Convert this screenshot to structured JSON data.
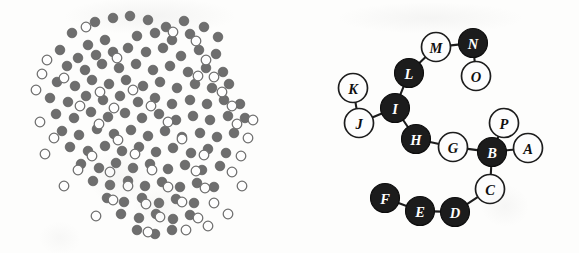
{
  "figure": {
    "background_color": "#fdfdfc",
    "panels": [
      {
        "id": "cluster",
        "name": "Particle cluster scatter"
      },
      {
        "id": "graph",
        "name": "Labeled node-link chain graph"
      }
    ]
  },
  "cluster_panel": {
    "name": "particle-cluster",
    "filled_color": "#6e6e6e",
    "open_fill_color": "#fefefe",
    "open_stroke_color": "#6f6f6f",
    "dot_radius": 4.8,
    "filled_count": 104,
    "open_count": 52,
    "total_count": 156,
    "filled_dots": [
      [
        95,
        22
      ],
      [
        113,
        18
      ],
      [
        130,
        16
      ],
      [
        148,
        20
      ],
      [
        166,
        27
      ],
      [
        184,
        21
      ],
      [
        204,
        27
      ],
      [
        72,
        33
      ],
      [
        88,
        45
      ],
      [
        105,
        40
      ],
      [
        137,
        36
      ],
      [
        155,
        33
      ],
      [
        172,
        40
      ],
      [
        190,
        34
      ],
      [
        218,
        37
      ],
      [
        60,
        50
      ],
      [
        78,
        58
      ],
      [
        96,
        55
      ],
      [
        113,
        52
      ],
      [
        128,
        48
      ],
      [
        146,
        52
      ],
      [
        163,
        48
      ],
      [
        181,
        56
      ],
      [
        199,
        50
      ],
      [
        216,
        54
      ],
      [
        67,
        66
      ],
      [
        85,
        70
      ],
      [
        102,
        64
      ],
      [
        119,
        68
      ],
      [
        136,
        64
      ],
      [
        153,
        70
      ],
      [
        170,
        66
      ],
      [
        188,
        72
      ],
      [
        206,
        68
      ],
      [
        223,
        72
      ],
      [
        57,
        82
      ],
      [
        75,
        86
      ],
      [
        92,
        80
      ],
      [
        109,
        84
      ],
      [
        126,
        80
      ],
      [
        143,
        86
      ],
      [
        160,
        82
      ],
      [
        177,
        88
      ],
      [
        195,
        84
      ],
      [
        212,
        88
      ],
      [
        229,
        84
      ],
      [
        50,
        98
      ],
      [
        68,
        102
      ],
      [
        86,
        96
      ],
      [
        103,
        100
      ],
      [
        120,
        96
      ],
      [
        138,
        102
      ],
      [
        155,
        98
      ],
      [
        172,
        104
      ],
      [
        190,
        100
      ],
      [
        207,
        104
      ],
      [
        224,
        100
      ],
      [
        240,
        104
      ],
      [
        56,
        114
      ],
      [
        74,
        118
      ],
      [
        91,
        112
      ],
      [
        108,
        117
      ],
      [
        125,
        113
      ],
      [
        142,
        118
      ],
      [
        159,
        114
      ],
      [
        176,
        120
      ],
      [
        193,
        116
      ],
      [
        210,
        120
      ],
      [
        228,
        116
      ],
      [
        245,
        118
      ],
      [
        62,
        131
      ],
      [
        79,
        135
      ],
      [
        97,
        129
      ],
      [
        114,
        134
      ],
      [
        131,
        130
      ],
      [
        148,
        136
      ],
      [
        165,
        131
      ],
      [
        182,
        137
      ],
      [
        200,
        133
      ],
      [
        217,
        137
      ],
      [
        234,
        133
      ],
      [
        70,
        147
      ],
      [
        88,
        151
      ],
      [
        105,
        146
      ],
      [
        122,
        151
      ],
      [
        139,
        147
      ],
      [
        156,
        152
      ],
      [
        173,
        148
      ],
      [
        191,
        153
      ],
      [
        208,
        149
      ],
      [
        226,
        153
      ],
      [
        81,
        164
      ],
      [
        99,
        168
      ],
      [
        116,
        163
      ],
      [
        133,
        168
      ],
      [
        150,
        164
      ],
      [
        168,
        169
      ],
      [
        185,
        165
      ],
      [
        202,
        170
      ],
      [
        220,
        166
      ],
      [
        93,
        181
      ],
      [
        110,
        185
      ],
      [
        128,
        181
      ],
      [
        145,
        186
      ],
      [
        162,
        182
      ],
      [
        180,
        187
      ],
      [
        197,
        183
      ],
      [
        214,
        187
      ],
      [
        107,
        198
      ],
      [
        124,
        202
      ],
      [
        142,
        198
      ],
      [
        159,
        203
      ],
      [
        176,
        199
      ],
      [
        194,
        203
      ],
      [
        121,
        214
      ],
      [
        139,
        218
      ],
      [
        156,
        214
      ],
      [
        173,
        219
      ],
      [
        190,
        215
      ],
      [
        137,
        230
      ],
      [
        155,
        234
      ],
      [
        172,
        230
      ]
    ],
    "open_dots": [
      [
        86,
        27
      ],
      [
        173,
        32
      ],
      [
        196,
        41
      ],
      [
        47,
        60
      ],
      [
        117,
        58
      ],
      [
        206,
        60
      ],
      [
        42,
        74
      ],
      [
        64,
        78
      ],
      [
        198,
        76
      ],
      [
        214,
        77
      ],
      [
        36,
        90
      ],
      [
        100,
        92
      ],
      [
        133,
        90
      ],
      [
        222,
        92
      ],
      [
        80,
        106
      ],
      [
        114,
        108
      ],
      [
        151,
        106
      ],
      [
        232,
        106
      ],
      [
        40,
        122
      ],
      [
        99,
        124
      ],
      [
        168,
        122
      ],
      [
        237,
        124
      ],
      [
        253,
        120
      ],
      [
        54,
        138
      ],
      [
        118,
        140
      ],
      [
        182,
        139
      ],
      [
        248,
        138
      ],
      [
        45,
        154
      ],
      [
        92,
        156
      ],
      [
        135,
        154
      ],
      [
        204,
        155
      ],
      [
        241,
        156
      ],
      [
        78,
        170
      ],
      [
        110,
        172
      ],
      [
        152,
        170
      ],
      [
        196,
        171
      ],
      [
        232,
        172
      ],
      [
        64,
        186
      ],
      [
        128,
        186
      ],
      [
        168,
        187
      ],
      [
        205,
        188
      ],
      [
        242,
        186
      ],
      [
        113,
        200
      ],
      [
        146,
        204
      ],
      [
        182,
        202
      ],
      [
        214,
        203
      ],
      [
        96,
        216
      ],
      [
        160,
        217
      ],
      [
        198,
        218
      ],
      [
        228,
        214
      ],
      [
        148,
        232
      ],
      [
        186,
        230
      ],
      [
        208,
        226
      ]
    ]
  },
  "graph_panel": {
    "name": "node-link-graph",
    "node_radius": 14.5,
    "black_fill": "#1c1c1c",
    "white_fill": "#fdfdfd",
    "edge_color": "#1d1d1d",
    "black_label_color": "#ffffff",
    "white_label_color": "#101010",
    "node_count": 16,
    "edge_count": 15,
    "black_node_count": 8,
    "white_node_count": 8,
    "nodes": [
      {
        "label": "A",
        "x": 232,
        "y": 148,
        "fill": "white"
      },
      {
        "label": "B",
        "x": 196,
        "y": 152,
        "fill": "black"
      },
      {
        "label": "C",
        "x": 194,
        "y": 189,
        "fill": "white"
      },
      {
        "label": "D",
        "x": 159,
        "y": 212,
        "fill": "black"
      },
      {
        "label": "E",
        "x": 124,
        "y": 211,
        "fill": "black"
      },
      {
        "label": "F",
        "x": 89,
        "y": 198,
        "fill": "black"
      },
      {
        "label": "G",
        "x": 157,
        "y": 147,
        "fill": "white"
      },
      {
        "label": "H",
        "x": 120,
        "y": 139,
        "fill": "black"
      },
      {
        "label": "I",
        "x": 99,
        "y": 108,
        "fill": "black"
      },
      {
        "label": "J",
        "x": 63,
        "y": 123,
        "fill": "white"
      },
      {
        "label": "K",
        "x": 57,
        "y": 88,
        "fill": "white"
      },
      {
        "label": "L",
        "x": 113,
        "y": 73,
        "fill": "black"
      },
      {
        "label": "M",
        "x": 140,
        "y": 47,
        "fill": "white"
      },
      {
        "label": "N",
        "x": 177,
        "y": 43,
        "fill": "black"
      },
      {
        "label": "O",
        "x": 180,
        "y": 76,
        "fill": "white"
      },
      {
        "label": "P",
        "x": 208,
        "y": 123,
        "fill": "white"
      }
    ],
    "edges": [
      [
        "A",
        "B"
      ],
      [
        "B",
        "P"
      ],
      [
        "B",
        "G"
      ],
      [
        "B",
        "C"
      ],
      [
        "C",
        "D"
      ],
      [
        "D",
        "E"
      ],
      [
        "E",
        "F"
      ],
      [
        "G",
        "H"
      ],
      [
        "H",
        "I"
      ],
      [
        "I",
        "L"
      ],
      [
        "I",
        "J"
      ],
      [
        "J",
        "K"
      ],
      [
        "L",
        "M"
      ],
      [
        "M",
        "N"
      ],
      [
        "N",
        "O"
      ]
    ],
    "chain_order": [
      "A",
      "B",
      "C",
      "D",
      "E",
      "F"
    ],
    "branch_labels": [
      "P",
      "G",
      "H",
      "I",
      "J",
      "K",
      "L",
      "M",
      "N",
      "O"
    ]
  }
}
